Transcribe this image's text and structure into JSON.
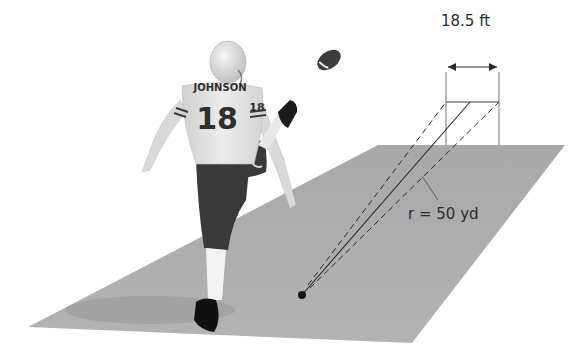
{
  "diagram": {
    "labels": {
      "goal_width": "18.5 ft",
      "distance": "r = 50 yd"
    },
    "player": {
      "name": "JOHNSON",
      "number": "18",
      "sleeve_number": "18"
    },
    "colors": {
      "field": "#a9a9a9",
      "background": "#ffffff",
      "lines": "#2a2a2a",
      "jersey": "#e6e6e6",
      "pants": "#3a3a3a"
    }
  }
}
